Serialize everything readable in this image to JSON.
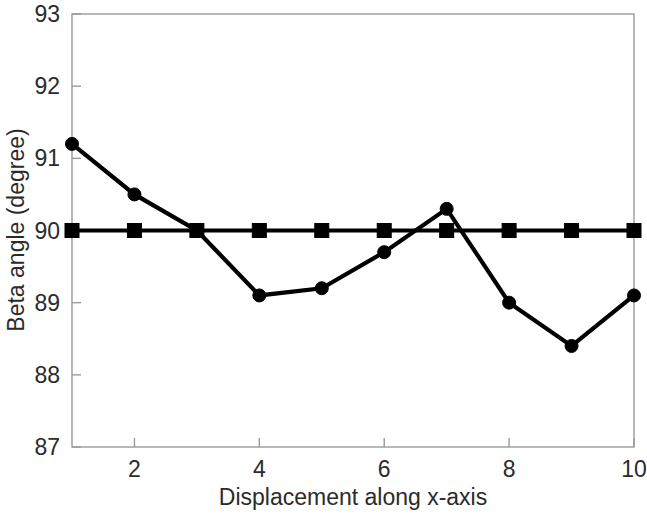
{
  "chart_data": {
    "type": "line",
    "title": "",
    "xlabel": "Displacement along x-axis",
    "ylabel": "Beta angle (degree)",
    "x": [
      1,
      2,
      3,
      4,
      5,
      6,
      7,
      8,
      9,
      10
    ],
    "xlim": [
      1,
      10
    ],
    "ylim": [
      87,
      93
    ],
    "xticks": [
      2,
      4,
      6,
      8,
      10
    ],
    "xtick_labels": [
      "2",
      "4",
      "6",
      "8",
      "10"
    ],
    "yticks": [
      87,
      88,
      89,
      90,
      91,
      92,
      93
    ],
    "ytick_labels": [
      "87",
      "88",
      "89",
      "90",
      "91",
      "92",
      "93"
    ],
    "grid": false,
    "legend": "none",
    "series": [
      {
        "name": "measured-beta-angle",
        "marker": "circle",
        "color": "#000000",
        "values": [
          91.2,
          90.5,
          90.0,
          89.1,
          89.2,
          89.7,
          90.3,
          89.0,
          88.4,
          89.1
        ]
      },
      {
        "name": "reference-beta-angle",
        "marker": "square",
        "color": "#000000",
        "values": [
          90.0,
          90.0,
          90.0,
          90.0,
          90.0,
          90.0,
          90.0,
          90.0,
          90.0,
          90.0
        ]
      }
    ]
  },
  "axes": {
    "ylabel_text": "Beta angle (degree)",
    "xlabel_text": "Displacement along x-axis"
  },
  "colors": {
    "line": "#000000",
    "frame": "#9a9a9a",
    "text": "#2b2b2b",
    "background": "#ffffff"
  }
}
